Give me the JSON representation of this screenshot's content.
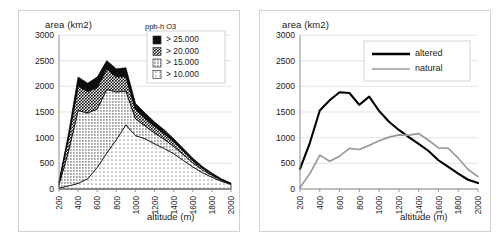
{
  "figure": {
    "panels": [
      "stacked-area-ozone-exposure",
      "line-altered-natural"
    ]
  },
  "left": {
    "ylabel": "area (km2)",
    "xlabel": "altitude (m)",
    "legend_title": "ppb-h O3",
    "legend_items": [
      {
        "label": "> 25.000",
        "pattern": "solid-black"
      },
      {
        "label": "> 20.000",
        "pattern": "dense-crosshatch"
      },
      {
        "label": "> 15.000",
        "pattern": "medium-dot"
      },
      {
        "label": "> 10.000",
        "pattern": "sparse-dot"
      }
    ]
  },
  "right": {
    "ylabel": "area (km2)",
    "xlabel": "altitude (m)",
    "legend_items": [
      {
        "label": "altered",
        "color": "#000000"
      },
      {
        "label": "natural",
        "color": "#9a9a9a"
      }
    ]
  },
  "chart_data": [
    {
      "type": "area",
      "id": "ozone-exposure-by-altitude",
      "title": "",
      "xlabel": "altitude (m)",
      "ylabel": "area (km2)",
      "legend_title": "ppb-h O3",
      "legend_position": "top-right",
      "grid": true,
      "stacked": true,
      "xlim": [
        200,
        2000
      ],
      "ylim": [
        0,
        3000
      ],
      "yticks": [
        0,
        500,
        1000,
        1500,
        2000,
        2500,
        3000
      ],
      "xticks": [
        200,
        400,
        600,
        800,
        1000,
        1200,
        1400,
        1600,
        1800,
        2000
      ],
      "x": [
        200,
        300,
        400,
        500,
        600,
        700,
        800,
        900,
        1000,
        1100,
        1200,
        1300,
        1400,
        1500,
        1600,
        1700,
        1800,
        1900,
        2000
      ],
      "series": [
        {
          "name": "> 10.000",
          "pattern": "sparse-dot",
          "values": [
            20,
            60,
            110,
            200,
            420,
            700,
            960,
            1250,
            1040,
            980,
            880,
            790,
            690,
            560,
            430,
            320,
            230,
            150,
            90
          ]
        },
        {
          "name": "> 15.000",
          "pattern": "medium-dot",
          "values": [
            60,
            680,
            1420,
            1280,
            1140,
            1240,
            930,
            660,
            330,
            250,
            210,
            180,
            140,
            110,
            80,
            55,
            35,
            20,
            10
          ]
        },
        {
          "name": "> 20.000",
          "pattern": "dense-crosshatch",
          "values": [
            40,
            250,
            480,
            420,
            420,
            400,
            300,
            280,
            180,
            150,
            130,
            110,
            90,
            70,
            50,
            35,
            25,
            15,
            8
          ]
        },
        {
          "name": "> 25.000",
          "pattern": "solid-black",
          "values": [
            20,
            90,
            170,
            160,
            200,
            160,
            150,
            170,
            120,
            100,
            85,
            75,
            60,
            50,
            40,
            30,
            20,
            12,
            6
          ]
        }
      ],
      "stack_totals": [
        140,
        1080,
        2180,
        2060,
        2180,
        2500,
        2340,
        2360,
        1670,
        1480,
        1305,
        1155,
        980,
        790,
        600,
        440,
        310,
        197,
        114
      ]
    },
    {
      "type": "line",
      "id": "altered-vs-natural-area-by-altitude",
      "title": "",
      "xlabel": "altitude (m)",
      "ylabel": "area (km2)",
      "legend_position": "top-right",
      "grid": true,
      "xlim": [
        200,
        2000
      ],
      "ylim": [
        0,
        3000
      ],
      "yticks": [
        0,
        500,
        1000,
        1500,
        2000,
        2500,
        3000
      ],
      "xticks": [
        200,
        400,
        600,
        800,
        1000,
        1200,
        1400,
        1600,
        1800,
        2000
      ],
      "x": [
        200,
        300,
        400,
        500,
        600,
        700,
        800,
        900,
        1000,
        1100,
        1200,
        1300,
        1400,
        1500,
        1600,
        1700,
        1800,
        1900,
        2000
      ],
      "series": [
        {
          "name": "altered",
          "color": "#000000",
          "values": [
            390,
            900,
            1530,
            1730,
            1885,
            1870,
            1640,
            1800,
            1520,
            1310,
            1150,
            1010,
            880,
            740,
            560,
            430,
            300,
            180,
            115
          ]
        },
        {
          "name": "natural",
          "color": "#9a9a9a",
          "values": [
            30,
            300,
            660,
            540,
            640,
            790,
            770,
            850,
            940,
            1010,
            1055,
            1050,
            1080,
            950,
            800,
            790,
            600,
            380,
            240
          ]
        }
      ]
    }
  ]
}
